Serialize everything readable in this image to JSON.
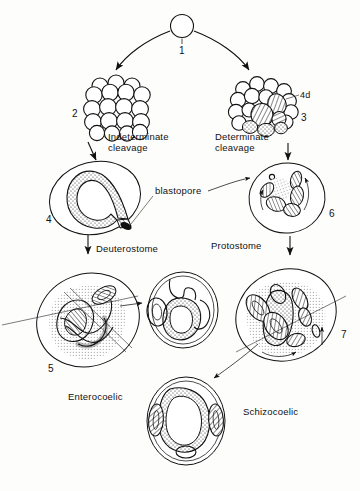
{
  "figure": {
    "background_color": "#fdfdfc",
    "ink_color": "#111111"
  },
  "stages": {
    "zygote": {
      "number": "1",
      "name": "fertilized-egg"
    },
    "radial_blastula": {
      "number": "2",
      "name": "indeterminate-cleavage-blastula"
    },
    "spiral_blastula": {
      "number": "3",
      "sub_label": "4d",
      "name": "determinate-cleavage-blastula"
    },
    "deuterostome_gastrula": {
      "number": "4",
      "name": "deuterostome-gastrula"
    },
    "protostome_gastrula": {
      "number": "6",
      "name": "protostome-gastrula"
    },
    "enterocoelic_embryo": {
      "number": "5",
      "name": "enterocoelic-embryo"
    },
    "schizocoelic_embryo": {
      "number": "7",
      "name": "schizocoelic-embryo"
    }
  },
  "labels": {
    "indeterminate_cleavage_line1": "Indeterminate",
    "indeterminate_cleavage_line2": "cleavage",
    "determinate_cleavage_line1": "Determinate",
    "determinate_cleavage_line2": "cleavage",
    "blastopore": "blastopore",
    "deuterostome": "Deuterostome",
    "protostome": "Protostome",
    "enterocoelic": "Enterocoelic",
    "schizocoelic": "Schizocoelic",
    "four_d": "4d"
  },
  "numbers": {
    "one": "1",
    "two": "2",
    "three": "3",
    "four": "4",
    "five": "5",
    "six": "6",
    "seven": "7"
  },
  "cross_sections": {
    "enterocoel_section": {
      "name": "enterocoel-cross-section"
    },
    "schizocoel_section": {
      "name": "schizocoel-cross-section"
    }
  }
}
